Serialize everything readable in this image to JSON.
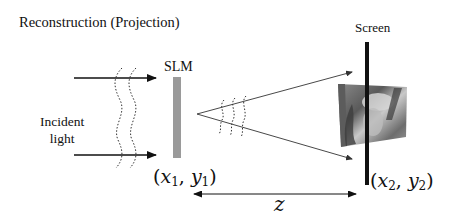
{
  "diagram": {
    "title": "Reconstruction (Projection)",
    "slm_label": "SLM",
    "screen_label": "Screen",
    "incident_label_line1": "Incident",
    "incident_label_line2": "light",
    "slm_coords": {
      "x": "x",
      "x_sub": "1",
      "y": "y",
      "y_sub": "1"
    },
    "screen_coords": {
      "x": "x",
      "x_sub": "2",
      "y": "y",
      "y_sub": "2"
    },
    "distance_label": "z",
    "projected_image": "portrait photo (grayscale)",
    "colors": {
      "slm_bar": "#9a9a9a",
      "screen_bar": "#111111",
      "arrow": "#111111",
      "background": "#ffffff"
    }
  }
}
